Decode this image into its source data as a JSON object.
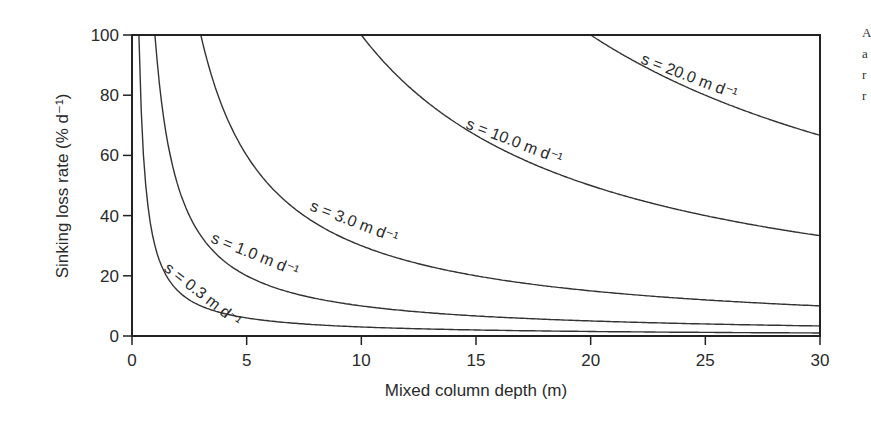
{
  "chart_data": {
    "type": "line",
    "title": "",
    "xlabel": "Mixed column depth (m)",
    "ylabel": "Sinking loss rate (% d⁻¹)",
    "xlim": [
      0,
      30
    ],
    "ylim": [
      0,
      100
    ],
    "x_ticks": [
      0,
      5,
      10,
      15,
      20,
      25,
      30
    ],
    "y_ticks": [
      0,
      20,
      40,
      60,
      80,
      100
    ],
    "grid": false,
    "legend": "inline labels on curves",
    "formula": "loss = 100 * s / z, capped at 100",
    "series": [
      {
        "name": "s = 0.3 m d⁻¹",
        "s": 0.3,
        "x": [
          0.3,
          1,
          2,
          3,
          5,
          10,
          15,
          20,
          30
        ],
        "y": [
          100,
          30,
          15,
          10,
          6,
          3,
          2,
          1.5,
          1
        ],
        "label": {
          "text": "s = 0.3 m d⁻¹",
          "x": 163,
          "y": 270,
          "angle": 38
        }
      },
      {
        "name": "s = 1.0 m d⁻¹",
        "s": 1.0,
        "x": [
          1,
          2,
          3,
          5,
          10,
          15,
          20,
          30
        ],
        "y": [
          100,
          50,
          33.3,
          20,
          10,
          6.7,
          5,
          3.3
        ],
        "label": {
          "text": "s = 1.0 m d⁻¹",
          "x": 210,
          "y": 242,
          "angle": 22
        }
      },
      {
        "name": "s = 3.0 m d⁻¹",
        "s": 3.0,
        "x": [
          3,
          5,
          10,
          15,
          20,
          25,
          30
        ],
        "y": [
          100,
          60,
          30,
          20,
          15,
          12,
          10
        ],
        "label": {
          "text": "s = 3.0 m d⁻¹",
          "x": 309,
          "y": 210,
          "angle": 21
        }
      },
      {
        "name": "s = 10.0 m d⁻¹",
        "s": 10.0,
        "x": [
          10,
          15,
          20,
          25,
          30
        ],
        "y": [
          100,
          66.7,
          50,
          40,
          33.3
        ],
        "label": {
          "text": "s = 10.0 m d⁻¹",
          "x": 465,
          "y": 128,
          "angle": 21
        }
      },
      {
        "name": "s = 20.0 m d⁻¹",
        "s": 20.0,
        "x": [
          20,
          25,
          30
        ],
        "y": [
          100,
          80,
          66.7
        ],
        "label": {
          "text": "s = 20.0 m d⁻¹",
          "x": 640,
          "y": 63,
          "angle": 21
        }
      }
    ]
  },
  "margin_text": [
    "A",
    "a",
    "r",
    "r"
  ]
}
